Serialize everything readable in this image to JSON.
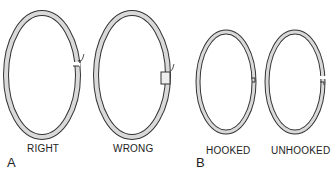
{
  "figure": {
    "panels": [
      {
        "id": "A",
        "letter": "A",
        "rings": [
          {
            "label": "RIGHT",
            "state": "gap ends aligned, arrow marks gap"
          },
          {
            "label": "WRONG",
            "state": "gap ends overlapped, arrow marks gap"
          }
        ]
      },
      {
        "id": "B",
        "letter": "B",
        "rings": [
          {
            "label": "HOOKED",
            "state": "ring ends hooked together"
          },
          {
            "label": "UNHOOKED",
            "state": "ring ends separated"
          }
        ]
      }
    ],
    "colors": {
      "ring_fill": "#d9d9d9",
      "ring_outline": "#333333",
      "background": "#ffffff"
    }
  }
}
